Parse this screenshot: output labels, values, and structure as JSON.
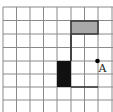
{
  "diagram": {
    "type": "grid-figure",
    "grid": {
      "x_lines": [
        3,
        16.5,
        30,
        43.5,
        57,
        71,
        84.5,
        98,
        112
      ],
      "y_lines": [
        7,
        20.5,
        34,
        47.5,
        61,
        74,
        87,
        100
      ],
      "x_extent": [
        3,
        113
      ],
      "y_extent": [
        7,
        112
      ],
      "line_color": "#8a8a8a"
    },
    "shapes": {
      "gray_rect": {
        "x": 71,
        "y": 21,
        "w": 27,
        "h": 13,
        "fill": "#a9a9a9",
        "stroke": "#333333"
      },
      "black_rect": {
        "x": 57,
        "y": 61,
        "w": 14,
        "h": 26,
        "fill": "#111111"
      },
      "path": {
        "points": [
          [
            71,
            34
          ],
          [
            71,
            61
          ]
        ],
        "stroke": "#444444"
      },
      "bottom_line": {
        "points": [
          [
            71,
            87
          ],
          [
            98,
            87
          ]
        ],
        "stroke": "#333333"
      }
    },
    "point": {
      "name": "A",
      "x": 97.5,
      "y": 61,
      "color": "#000000"
    },
    "labels": {
      "point_label": "A"
    }
  }
}
